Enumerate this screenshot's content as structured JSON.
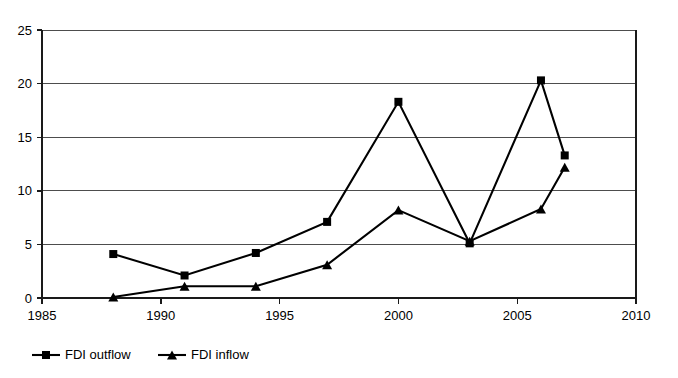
{
  "chart_data": {
    "type": "line",
    "title": "",
    "subtitle": "",
    "xlabel": "",
    "ylabel": "",
    "x": [
      1988,
      1991,
      1994,
      1997,
      2000,
      2003,
      2006,
      2007
    ],
    "series": [
      {
        "name": "FDI outflow",
        "marker": "square",
        "color": "#000000",
        "values": [
          4.1,
          2.1,
          4.2,
          7.1,
          18.3,
          5.1,
          20.3,
          13.3
        ]
      },
      {
        "name": "FDI inflow",
        "marker": "triangle",
        "color": "#000000",
        "values": [
          0.1,
          1.1,
          1.1,
          3.1,
          8.2,
          5.3,
          8.3,
          12.2
        ]
      }
    ],
    "xlim": [
      1985,
      2010
    ],
    "ylim": [
      0,
      25
    ],
    "xticks": [
      1985,
      1990,
      1995,
      2000,
      2005,
      2010
    ],
    "xtick_labels": [
      "1985",
      "1990",
      "1995",
      "2000",
      "2005",
      "2010"
    ],
    "yticks": [
      0,
      5,
      10,
      15,
      20,
      25
    ],
    "ytick_labels": [
      "0",
      "5",
      "10",
      "15",
      "20",
      "25"
    ],
    "grid": {
      "horizontal": true,
      "vertical": false
    },
    "legend": {
      "position": "bottom-left",
      "orientation": "horizontal",
      "entries": [
        "FDI outflow",
        "FDI inflow"
      ]
    },
    "annotations": [],
    "background_color": "#ffffff",
    "axis_color": "#1a1a1a",
    "grid_color": "#4d4d4d"
  }
}
